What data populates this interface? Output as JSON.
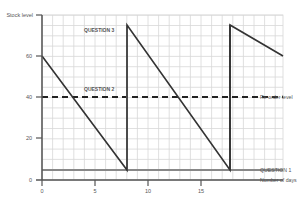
{
  "chart_data": {
    "type": "line",
    "title": "",
    "xlabel": "Number of days",
    "ylabel": "Stock level",
    "xlim": [
      0,
      22.7
    ],
    "ylim": [
      0,
      80
    ],
    "xticks": [
      0,
      5,
      10,
      15
    ],
    "yticks": [
      0,
      20,
      40,
      60
    ],
    "grid": true,
    "series": [
      {
        "name": "Stock level",
        "x": [
          0,
          8,
          8,
          17.7,
          17.7,
          22.7
        ],
        "y": [
          60,
          5,
          75,
          5,
          75,
          60
        ],
        "style": "solid",
        "color": "#333333"
      },
      {
        "name": "Re-order level",
        "x": [
          0,
          22.7
        ],
        "y": [
          40,
          40
        ],
        "style": "dashed",
        "color": "#222222"
      },
      {
        "name": "QUESTION 1",
        "x": [
          0,
          22.7
        ],
        "y": [
          5,
          5
        ],
        "style": "solid",
        "color": "#888888"
      }
    ],
    "vertical_markers": [
      {
        "x": 8,
        "color": "#aaaaaa"
      },
      {
        "x": 17.7,
        "color": "#222222"
      }
    ],
    "annotations": [
      {
        "text": "QUESTION 3",
        "x": 11,
        "y": 72
      },
      {
        "text": "QUESTION 2",
        "x": 11,
        "y": 40
      },
      {
        "text": "Re-order level",
        "x": 23,
        "y": 40
      },
      {
        "text": "QUESTION 1",
        "x": 23,
        "y": 5
      },
      {
        "text": "Number of days",
        "x": 23,
        "y": 0
      }
    ]
  },
  "labels": {
    "y_axis_title": "Stock level",
    "x_axis_title": "Number of days",
    "reorder": "Re-order level",
    "q1": "QUESTION 1",
    "q2": "QUESTION 2",
    "q3": "QUESTION 3",
    "yt0": "0",
    "yt20": "20",
    "yt40": "40",
    "yt60": "60",
    "xt0": "0",
    "xt5": "5",
    "xt10": "10",
    "xt15": "15"
  }
}
